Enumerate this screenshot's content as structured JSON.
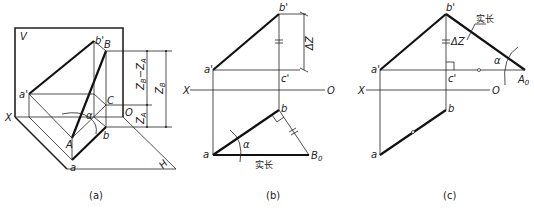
{
  "figures": [
    {
      "id": "a",
      "caption": "(a)",
      "labels": {
        "V": "V",
        "X": "X",
        "O": "O",
        "H": "H",
        "a_prime": "a'",
        "b_prime": "b'",
        "B": "B",
        "C": "C",
        "A": "A",
        "a": "a",
        "b": "b",
        "alpha": "α",
        "dim_diff": "Z",
        "dim_diff_sub1": "B",
        "dim_diff_mid": "−Z",
        "dim_diff_sub2": "A",
        "dim_zb": "Z",
        "dim_zb_sub": "B",
        "dim_za": "Z",
        "dim_za_sub": "A"
      }
    },
    {
      "id": "b",
      "caption": "(b)",
      "labels": {
        "b_prime": "b'",
        "a_prime": "a'",
        "c_prime": "c'",
        "X": "X",
        "O": "O",
        "b": "b",
        "a": "a",
        "B0": "B",
        "B0_sub": "0",
        "alpha": "α",
        "delta_z": "ΔZ",
        "true_length": "实长"
      }
    },
    {
      "id": "c",
      "caption": "(c)",
      "labels": {
        "b_prime": "b'",
        "a_prime": "a'",
        "c_prime": "c'",
        "X": "X",
        "O": "O",
        "b": "b",
        "a": "a",
        "A0": "A",
        "A0_sub": "0",
        "alpha": "α",
        "delta_z": "ΔZ",
        "true_length": "实长"
      }
    }
  ]
}
